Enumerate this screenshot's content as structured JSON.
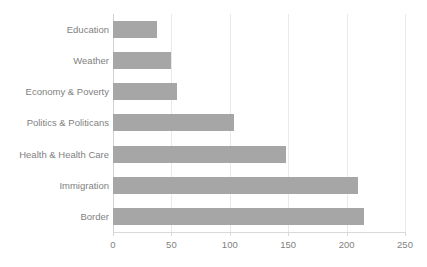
{
  "chart_data": {
    "type": "bar",
    "orientation": "horizontal",
    "title": "",
    "subtitle": "",
    "xlabel": "",
    "ylabel": "",
    "categories": [
      "Education",
      "Weather",
      "Economy & Poverty",
      "Politics & Politicans",
      "Health & Health Care",
      "Immigration",
      "Border"
    ],
    "values": [
      38,
      50,
      55,
      104,
      148,
      210,
      215
    ],
    "xlim": [
      0,
      250
    ],
    "xticks": [
      0,
      50,
      100,
      150,
      200,
      250
    ],
    "xtick_labels": [
      "0",
      "50",
      "100",
      "150",
      "200",
      "250"
    ],
    "grid": "vertical",
    "legend": "none",
    "annotations": [],
    "colors": {
      "bar": "#a6a6a6",
      "text": "#7f7f7f",
      "gridline": "#e9e9e9",
      "axis": "#d9d9d9",
      "background": "#ffffff"
    }
  }
}
